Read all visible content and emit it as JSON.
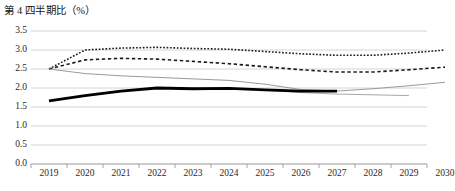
{
  "chart_data": {
    "type": "line",
    "title": "第 4 四半期比（%）",
    "xlabel": "",
    "ylabel": "",
    "x": [
      2019,
      2020,
      2021,
      2022,
      2023,
      2024,
      2025,
      2026,
      2027,
      2028,
      2029,
      2030
    ],
    "xlim": [
      2019,
      2030
    ],
    "ylim": [
      0.0,
      3.5
    ],
    "yticks": [
      0.0,
      0.5,
      1.0,
      1.5,
      2.0,
      2.5,
      3.0,
      3.5
    ],
    "ytick_labels": [
      "0.0",
      "0.5",
      "1.0",
      "1.5",
      "2.0",
      "2.5",
      "3.0",
      "3.5"
    ],
    "xtick_labels": [
      "2019",
      "2020",
      "2021",
      "2022",
      "2023",
      "2024",
      "2025",
      "2026",
      "2027",
      "2028",
      "2029",
      "2030"
    ],
    "grid": true,
    "grid_axis": "y",
    "legend": "none",
    "series": [
      {
        "name": "dotted-upper",
        "style": "dotted",
        "color": "#1c1c1c",
        "width": 1.6,
        "x": [
          2019,
          2020,
          2021,
          2022,
          2023,
          2024,
          2025,
          2026,
          2027,
          2028,
          2029,
          2030
        ],
        "values": [
          2.5,
          3.0,
          3.05,
          3.07,
          3.04,
          3.02,
          2.96,
          2.9,
          2.86,
          2.86,
          2.92,
          3.0
        ]
      },
      {
        "name": "dashed-middle",
        "style": "dashed",
        "color": "#1c1c1c",
        "width": 1.6,
        "x": [
          2019,
          2020,
          2021,
          2022,
          2023,
          2024,
          2025,
          2026,
          2027,
          2028,
          2029,
          2030
        ],
        "values": [
          2.5,
          2.74,
          2.78,
          2.76,
          2.7,
          2.64,
          2.56,
          2.48,
          2.42,
          2.42,
          2.48,
          2.55
        ]
      },
      {
        "name": "thin-gray-solid",
        "style": "solid",
        "color": "#9a9a9a",
        "width": 1.0,
        "x": [
          2019,
          2020,
          2021,
          2022,
          2023,
          2024,
          2025,
          2026,
          2027,
          2028,
          2029,
          2030
        ],
        "values": [
          2.5,
          2.38,
          2.32,
          2.28,
          2.24,
          2.2,
          2.1,
          1.96,
          1.92,
          1.98,
          2.06,
          2.15
        ]
      },
      {
        "name": "thin-gray-lower",
        "style": "solid",
        "color": "#a8a8a8",
        "width": 1.0,
        "x": [
          2025,
          2026,
          2027,
          2028,
          2029
        ],
        "values": [
          1.94,
          1.88,
          1.84,
          1.82,
          1.8
        ]
      },
      {
        "name": "thick-black-solid",
        "style": "solid",
        "color": "#000000",
        "width": 2.8,
        "x": [
          2019,
          2020,
          2021,
          2022,
          2023,
          2024,
          2025,
          2026,
          2027
        ],
        "values": [
          1.66,
          1.8,
          1.92,
          2.0,
          1.98,
          1.99,
          1.95,
          1.92,
          1.92
        ]
      }
    ]
  }
}
